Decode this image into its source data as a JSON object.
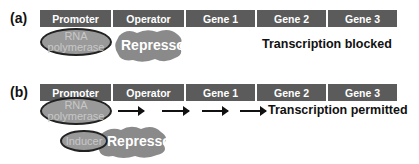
{
  "panels": [
    {
      "label": "(a)",
      "segments": [
        "Promoter",
        "Operator",
        "Gene 1",
        "Gene 2",
        "Gene 3"
      ],
      "rna_polymerase": {
        "line1": "RNA",
        "line2": "polymerase"
      },
      "repressor": "Repressor",
      "status": "Transcription blocked"
    },
    {
      "label": "(b)",
      "segments": [
        "Promoter",
        "Operator",
        "Gene 1",
        "Gene 2",
        "Gene 3"
      ],
      "rna_polymerase": {
        "line1": "RNA",
        "line2": "polymerase"
      },
      "inducer": "Inducer",
      "repressor": "Repressor",
      "status": "Transcription permitted"
    }
  ],
  "colors": {
    "segment_bg": "#5b5b5b",
    "shape_gray": "#999999",
    "outline": "#222222"
  }
}
